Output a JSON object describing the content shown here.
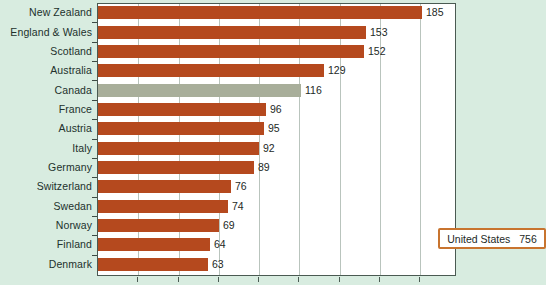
{
  "chart_data": {
    "type": "bar",
    "orientation": "horizontal",
    "title": "",
    "subtitle": "",
    "xlabel": "",
    "ylabel": "",
    "xlim": [
      0,
      205
    ],
    "grid": true,
    "gridline_interval": 23,
    "legend": "none",
    "categories": [
      "New Zealand",
      "England & Wales",
      "Scotland",
      "Australia",
      "Canada",
      "France",
      "Austria",
      "Italy",
      "Germany",
      "Switzerland",
      "Swedan",
      "Norway",
      "Finland",
      "Denmark"
    ],
    "values": [
      185,
      153,
      152,
      129,
      116,
      96,
      95,
      92,
      89,
      76,
      74,
      69,
      64,
      63
    ],
    "highlight_category": "Canada",
    "annotations": [
      {
        "name": "united-states-callout",
        "label": "United States",
        "value": "756"
      }
    ]
  },
  "colors": {
    "background": "#d8ece0",
    "plot_background": "#ffffff",
    "bar": "#b5491e",
    "bar_highlight": "#a8ae9a",
    "gridline": "#b9c4bd",
    "axis": "#4a5a52",
    "callout_border": "#c8742f",
    "text": "#1d2926"
  }
}
